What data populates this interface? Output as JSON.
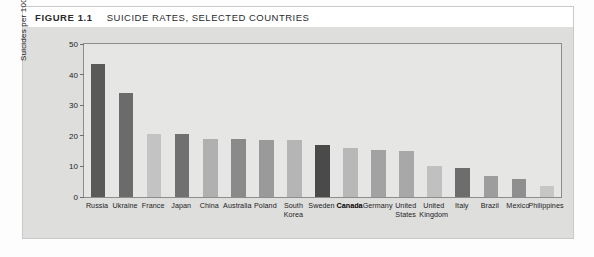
{
  "figure": {
    "number": "FIGURE 1.1",
    "title": "SUICIDE RATES, SELECTED COUNTRIES"
  },
  "colors": {
    "panel_bg": "#dededd",
    "plot_bg": "#e6e6e4",
    "frame": "#8d8d8d",
    "bar_dark": "#4a4a4a",
    "bar_mid": "#6f6f6f",
    "bar_medium": "#8a8a8a",
    "bar_light": "#a9a9a9",
    "bar_lighter": "#c3c3c3",
    "bar_palest": "#d5d5d3",
    "highlight_label": "#000000"
  },
  "chart_data": {
    "type": "bar",
    "title": "SUICIDE RATES, SELECTED COUNTRIES",
    "xlabel": "",
    "ylabel": "Suicides per 100 000 population",
    "ylim": [
      0,
      50
    ],
    "yticks": [
      0,
      10,
      20,
      30,
      40,
      50
    ],
    "grid": false,
    "legend": "none",
    "categories": [
      "Russia",
      "Ukraine",
      "France",
      "Japan",
      "China",
      "Australia",
      "Poland",
      "South Korea",
      "Sweden",
      "Canada",
      "Germany",
      "United States",
      "United Kingdom",
      "Italy",
      "Brazil",
      "Mexico",
      "Philippines"
    ],
    "values": [
      43.5,
      34,
      20.5,
      20.5,
      19,
      19,
      18.5,
      18.5,
      17,
      16,
      15.5,
      15,
      10,
      9.5,
      7,
      6,
      3.5
    ],
    "bar_shades": [
      "#5a5a5a",
      "#6b6b6b",
      "#c3c3c3",
      "#707070",
      "#b0b0b0",
      "#8a8a8a",
      "#9a9a9a",
      "#b5b5b5",
      "#4a4a4a",
      "#b8b8b8",
      "#a2a2a2",
      "#a8a8a8",
      "#c0c0c0",
      "#6d6d6d",
      "#9d9d9d",
      "#8f8f8f",
      "#c6c6c6"
    ],
    "highlighted_category": "Canada"
  }
}
